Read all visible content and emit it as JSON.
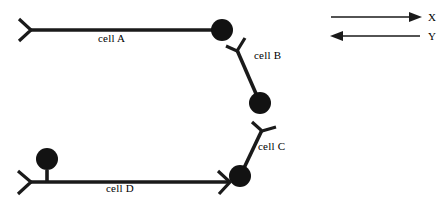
{
  "figure": {
    "type": "cell-chain-diagram",
    "background_color": "#ffffff",
    "ink_color": "#1a1a1a"
  },
  "cells": [
    {
      "id": "cell-a",
      "label": "cell A",
      "label_x": 98,
      "label_y": 38,
      "orientation": "horizontal",
      "fork_end": "left",
      "circle_end": "right",
      "line": {
        "x1": 30,
        "y1": 30,
        "x2": 216,
        "y2": 30
      },
      "circle": {
        "cx": 222,
        "cy": 30,
        "r": 11
      },
      "fork": {
        "apex_x": 30,
        "apex_y": 30,
        "tip1_x": 19,
        "tip1_y": 19,
        "tip2_x": 19,
        "tip2_y": 41
      }
    },
    {
      "id": "cell-b",
      "label": "cell B",
      "label_x": 254,
      "label_y": 55,
      "orientation": "diagonal-down-right",
      "fork_end": "top",
      "circle_end": "bottom",
      "line": {
        "x1": 237,
        "y1": 50,
        "x2": 257,
        "y2": 96
      },
      "circle": {
        "cx": 260,
        "cy": 103,
        "r": 11
      },
      "fork": {
        "apex_x": 237,
        "apex_y": 50,
        "tip1_x": 226,
        "tip1_y": 46,
        "tip2_x": 245,
        "tip2_y": 38
      }
    },
    {
      "id": "cell-c",
      "label": "cell C",
      "label_x": 258,
      "label_y": 146,
      "orientation": "diagonal-down-left",
      "fork_end": "top",
      "circle_end": "bottom",
      "line": {
        "x1": 262,
        "y1": 130,
        "x2": 244,
        "y2": 168
      },
      "circle": {
        "cx": 240,
        "cy": 176,
        "r": 11
      },
      "fork": {
        "apex_x": 262,
        "apex_y": 130,
        "tip1_x": 252,
        "tip1_y": 122,
        "tip2_x": 276,
        "tip2_y": 127
      }
    },
    {
      "id": "cell-d",
      "label": "cell D",
      "label_x": 106,
      "label_y": 188,
      "orientation": "horizontal",
      "fork_end": "left",
      "circle_end": "right",
      "line": {
        "x1": 30,
        "y1": 182,
        "x2": 229,
        "y2": 182
      },
      "circle": {
        "cx": 47,
        "cy": 159,
        "r": 11
      },
      "stalk": {
        "x1": 47,
        "y1": 170,
        "x2": 47,
        "y2": 182
      },
      "fork": {
        "apex_x": 30,
        "apex_y": 182,
        "tip1_x": 18,
        "tip1_y": 171,
        "tip2_x": 18,
        "tip2_y": 194
      },
      "end_fork": {
        "apex_x": 229,
        "apex_y": 182,
        "tip1_x": 218,
        "tip1_y": 172,
        "tip2_x": 229,
        "tip2_y": 194
      }
    }
  ],
  "legend": {
    "items": [
      {
        "id": "axis-x",
        "label": "X",
        "direction": "right",
        "line": {
          "x1": 331,
          "y1": 17,
          "x2": 420,
          "y2": 17
        },
        "label_x": 428,
        "label_y": 11
      },
      {
        "id": "axis-y",
        "label": "Y",
        "direction": "left",
        "line": {
          "x1": 331,
          "y1": 36,
          "x2": 420,
          "y2": 36
        },
        "label_x": 428,
        "label_y": 30
      }
    ]
  }
}
